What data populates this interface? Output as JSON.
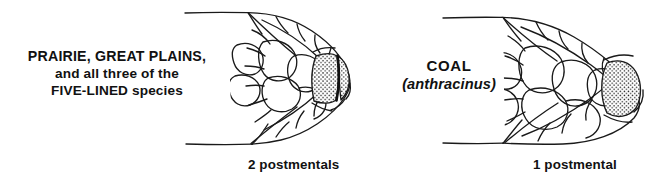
{
  "figure": {
    "type": "scientific-illustration",
    "background_color": "#ffffff",
    "ink_color": "#1a1a1a"
  },
  "panels": [
    {
      "id": "left",
      "label": {
        "line_1": "PRAIRIE, GREAT PLAINS,",
        "line_2": "and all three of the",
        "line_3": "FIVE-LINED species"
      },
      "caption": "2 postmentals",
      "postmental_count": 2,
      "diagram_name": "skink-head-two-postmentals"
    },
    {
      "id": "right",
      "label": {
        "line_1": "COAL",
        "line_2": "(anthracinus)"
      },
      "caption": "1 postmental",
      "postmental_count": 1,
      "diagram_name": "skink-head-one-postmental"
    }
  ]
}
